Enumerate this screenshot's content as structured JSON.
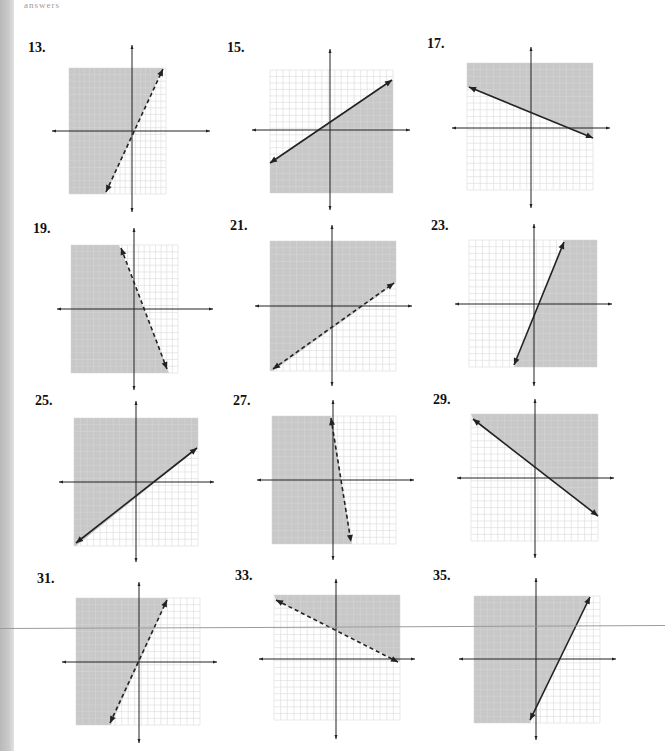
{
  "page": {
    "top_fragment": "answers",
    "shade_color": "#c8c8c8",
    "grid_color": "#d6d6d6",
    "axis_color": "#222222",
    "line_color": "#222222"
  },
  "problems": [
    {
      "number": "13.",
      "label_x": 28,
      "label_y": 52,
      "ox": 132,
      "oy": 131,
      "box": [
        69,
        68,
        166,
        194
      ],
      "axis": [
        52,
        210,
        45,
        212
      ],
      "line": [
        [
          106,
          192
        ],
        [
          163,
          69
        ]
      ],
      "dashed": true,
      "shade": [
        [
          69,
          68
        ],
        [
          163,
          68
        ],
        [
          106,
          194
        ],
        [
          69,
          194
        ]
      ]
    },
    {
      "number": "15.",
      "label_x": 227,
      "label_y": 52,
      "ox": 330,
      "oy": 130,
      "box": [
        270,
        70,
        393,
        193
      ],
      "axis": [
        252,
        410,
        49,
        210
      ],
      "line": [
        [
          270,
          163
        ],
        [
          392,
          80
        ]
      ],
      "dashed": false,
      "shade": [
        [
          270,
          163
        ],
        [
          393,
          80
        ],
        [
          393,
          193
        ],
        [
          270,
          193
        ]
      ]
    },
    {
      "number": "17.",
      "label_x": 427,
      "label_y": 48,
      "ox": 531,
      "oy": 128,
      "box": [
        467,
        63,
        593,
        190
      ],
      "axis": [
        452,
        610,
        47,
        208
      ],
      "line": [
        [
          469,
          87
        ],
        [
          593,
          138
        ]
      ],
      "dashed": false,
      "shade": [
        [
          467,
          63
        ],
        [
          593,
          63
        ],
        [
          593,
          138
        ],
        [
          467,
          87
        ]
      ]
    },
    {
      "number": "19.",
      "label_x": 33,
      "label_y": 233,
      "ox": 134,
      "oy": 309,
      "box": [
        71,
        245,
        178,
        373
      ],
      "axis": [
        57,
        213,
        228,
        390
      ],
      "line": [
        [
          121,
          248
        ],
        [
          167,
          369
        ]
      ],
      "dashed": true,
      "shade": [
        [
          71,
          245
        ],
        [
          119,
          245
        ],
        [
          169,
          373
        ],
        [
          71,
          373
        ]
      ]
    },
    {
      "number": "21.",
      "label_x": 230,
      "label_y": 230,
      "ox": 332,
      "oy": 306,
      "box": [
        270,
        241,
        396,
        371
      ],
      "axis": [
        255,
        412,
        225,
        386
      ],
      "line": [
        [
          273,
          369
        ],
        [
          394,
          283
        ]
      ],
      "dashed": true,
      "shade": [
        [
          270,
          241
        ],
        [
          396,
          241
        ],
        [
          396,
          283
        ],
        [
          273,
          371
        ],
        [
          270,
          371
        ]
      ]
    },
    {
      "number": "23.",
      "label_x": 431,
      "label_y": 230,
      "ox": 534,
      "oy": 304,
      "box": [
        469,
        240,
        597,
        367
      ],
      "axis": [
        455,
        612,
        224,
        386
      ],
      "line": [
        [
          514,
          365
        ],
        [
          564,
          242
        ]
      ],
      "dashed": false,
      "shade": [
        [
          564,
          240
        ],
        [
          597,
          240
        ],
        [
          597,
          367
        ],
        [
          514,
          367
        ]
      ]
    },
    {
      "number": "25.",
      "label_x": 35,
      "label_y": 405,
      "ox": 136,
      "oy": 482,
      "box": [
        74,
        418,
        198,
        546
      ],
      "axis": [
        59,
        214,
        401,
        562
      ],
      "line": [
        [
          76,
          543
        ],
        [
          197,
          448
        ]
      ],
      "dashed": false,
      "shade": [
        [
          74,
          418
        ],
        [
          198,
          418
        ],
        [
          198,
          448
        ],
        [
          76,
          546
        ],
        [
          74,
          546
        ]
      ]
    },
    {
      "number": "27.",
      "label_x": 233,
      "label_y": 405,
      "ox": 333,
      "oy": 480,
      "box": [
        272,
        416,
        396,
        544
      ],
      "axis": [
        257,
        414,
        400,
        560
      ],
      "line": [
        [
          331,
          418
        ],
        [
          351,
          542
        ]
      ],
      "dashed": true,
      "shade": [
        [
          272,
          416
        ],
        [
          331,
          416
        ],
        [
          352,
          544
        ],
        [
          272,
          544
        ]
      ]
    },
    {
      "number": "29.",
      "label_x": 433,
      "label_y": 404,
      "ox": 535,
      "oy": 478,
      "box": [
        471,
        414,
        598,
        541
      ],
      "axis": [
        457,
        614,
        399,
        558
      ],
      "line": [
        [
          473,
          419
        ],
        [
          598,
          516
        ]
      ],
      "dashed": false,
      "shade": [
        [
          471,
          414
        ],
        [
          598,
          414
        ],
        [
          598,
          516
        ],
        [
          473,
          419
        ]
      ]
    },
    {
      "number": "31.",
      "label_x": 37,
      "label_y": 583,
      "ox": 139,
      "oy": 662,
      "box": [
        76,
        598,
        200,
        725
      ],
      "axis": [
        62,
        217,
        582,
        743
      ],
      "line": [
        [
          110,
          723
        ],
        [
          167,
          600
        ]
      ],
      "dashed": true,
      "shade": [
        [
          76,
          598
        ],
        [
          168,
          598
        ],
        [
          111,
          725
        ],
        [
          76,
          725
        ]
      ]
    },
    {
      "number": "33.",
      "label_x": 235,
      "label_y": 580,
      "ox": 336,
      "oy": 659,
      "box": [
        274,
        595,
        400,
        720
      ],
      "axis": [
        259,
        415,
        579,
        739
      ],
      "line": [
        [
          276,
          600
        ],
        [
          398,
          662
        ]
      ],
      "dashed": true,
      "shade": [
        [
          274,
          595
        ],
        [
          400,
          595
        ],
        [
          400,
          662
        ],
        [
          276,
          600
        ]
      ]
    },
    {
      "number": "35.",
      "label_x": 433,
      "label_y": 580,
      "ox": 536,
      "oy": 659,
      "box": [
        474,
        596,
        600,
        723
      ],
      "axis": [
        459,
        616,
        578,
        740
      ],
      "line": [
        [
          530,
          720
        ],
        [
          590,
          597
        ]
      ],
      "dashed": false,
      "shade": [
        [
          474,
          596
        ],
        [
          590,
          596
        ],
        [
          530,
          723
        ],
        [
          474,
          723
        ]
      ]
    }
  ],
  "chart_data": [
    {
      "type": "scatter",
      "title": "13.",
      "xlim": [
        -10,
        10
      ],
      "ylim": [
        -10,
        10
      ],
      "grid": true,
      "boundary": "dashed",
      "slope": 2.2,
      "y_intercept": -0.5,
      "shaded_side": "left/above"
    },
    {
      "type": "scatter",
      "title": "15.",
      "xlim": [
        -10,
        10
      ],
      "ylim": [
        -10,
        10
      ],
      "grid": true,
      "boundary": "solid",
      "slope": 0.67,
      "y_intercept": 2,
      "shaded_side": "below"
    },
    {
      "type": "scatter",
      "title": "17.",
      "xlim": [
        -10,
        10
      ],
      "ylim": [
        -10,
        10
      ],
      "grid": true,
      "boundary": "solid",
      "slope": -0.4,
      "y_intercept": 3,
      "shaded_side": "above"
    },
    {
      "type": "scatter",
      "title": "19.",
      "xlim": [
        -10,
        10
      ],
      "ylim": [
        -10,
        10
      ],
      "grid": true,
      "boundary": "dashed",
      "slope": -2.5,
      "y_intercept": 5,
      "shaded_side": "left/below"
    },
    {
      "type": "scatter",
      "title": "21.",
      "xlim": [
        -10,
        10
      ],
      "ylim": [
        -10,
        10
      ],
      "grid": true,
      "boundary": "dashed",
      "slope": 0.67,
      "y_intercept": -4,
      "shaded_side": "above"
    },
    {
      "type": "scatter",
      "title": "23.",
      "xlim": [
        -10,
        10
      ],
      "ylim": [
        -10,
        10
      ],
      "grid": true,
      "boundary": "solid",
      "slope": 2.5,
      "y_intercept": -2,
      "shaded_side": "right/below"
    },
    {
      "type": "scatter",
      "title": "25.",
      "xlim": [
        -10,
        10
      ],
      "ylim": [
        -10,
        10
      ],
      "grid": true,
      "boundary": "solid",
      "slope": 0.75,
      "y_intercept": -3,
      "shaded_side": "above"
    },
    {
      "type": "scatter",
      "title": "27.",
      "xlim": [
        -10,
        10
      ],
      "ylim": [
        -10,
        10
      ],
      "grid": true,
      "boundary": "dashed",
      "slope": -6,
      "y_intercept": 6,
      "shaded_side": "left/below"
    },
    {
      "type": "scatter",
      "title": "29.",
      "xlim": [
        -10,
        10
      ],
      "ylim": [
        -10,
        10
      ],
      "grid": true,
      "boundary": "solid",
      "slope": -0.75,
      "y_intercept": 2,
      "shaded_side": "above"
    },
    {
      "type": "scatter",
      "title": "31.",
      "xlim": [
        -10,
        10
      ],
      "ylim": [
        -10,
        10
      ],
      "grid": true,
      "boundary": "dashed",
      "slope": 2,
      "y_intercept": 0,
      "shaded_side": "left/above"
    },
    {
      "type": "scatter",
      "title": "33.",
      "xlim": [
        -10,
        10
      ],
      "ylim": [
        -10,
        10
      ],
      "grid": true,
      "boundary": "dashed",
      "slope": -0.5,
      "y_intercept": 5,
      "shaded_side": "above"
    },
    {
      "type": "scatter",
      "title": "35.",
      "xlim": [
        -10,
        10
      ],
      "ylim": [
        -10,
        10
      ],
      "grid": true,
      "boundary": "solid",
      "slope": 2,
      "y_intercept": -6,
      "shaded_side": "left/above"
    }
  ]
}
